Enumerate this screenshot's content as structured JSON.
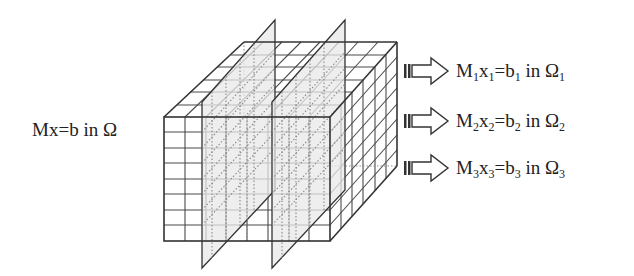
{
  "figure": {
    "type": "domain-decomposition-diagram",
    "global_problem": {
      "lhs": "Mx",
      "eq": "=",
      "rhs": "b",
      "in": "in",
      "domain": "Ω"
    },
    "subproblems": [
      {
        "M": "M",
        "x": "x",
        "b": "b",
        "in": "in",
        "domain": "Ω",
        "index": "1"
      },
      {
        "M": "M",
        "x": "x",
        "b": "b",
        "in": "in",
        "domain": "Ω",
        "index": "2"
      },
      {
        "M": "M",
        "x": "x",
        "b": "b",
        "in": "in",
        "domain": "Ω",
        "index": "3"
      }
    ],
    "cube": {
      "grid_cells_front": [
        3,
        8
      ],
      "grid_cells_side": 6,
      "cutting_planes": 2,
      "subdomains": 3
    },
    "colors": {
      "line": "#333333",
      "plane_fill": "#e6e6e6",
      "dotted": "#888888"
    }
  }
}
